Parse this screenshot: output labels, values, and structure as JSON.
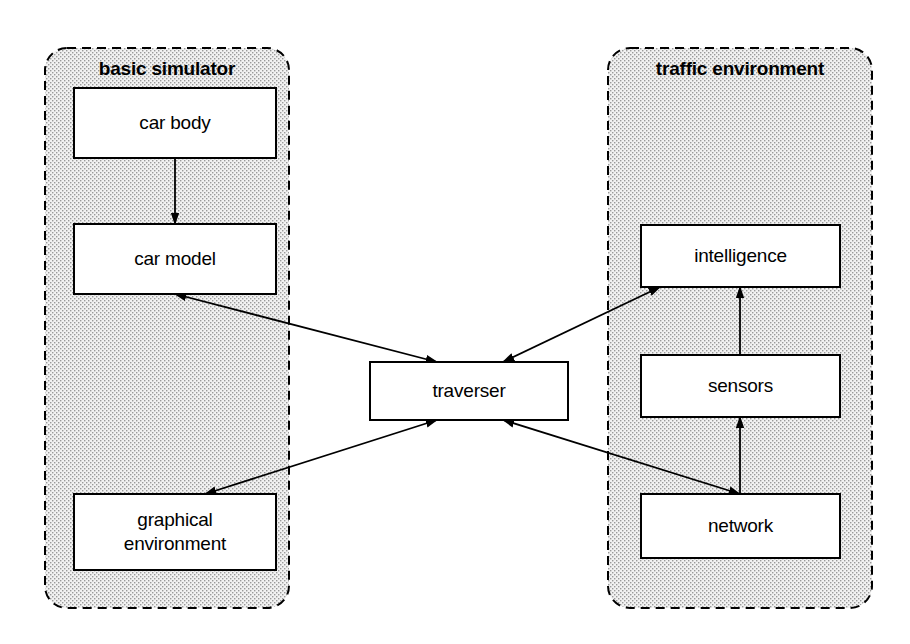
{
  "diagram": {
    "canvas": {
      "width": 910,
      "height": 644
    },
    "colors": {
      "stroke": "#000000",
      "group_fill": "#ececec",
      "group_border": "#000000",
      "node_fill": "#ffffff",
      "page_background": "#ffffff"
    },
    "groups": [
      {
        "id": "basic-simulator",
        "label": "basic simulator",
        "x": 45,
        "y": 48,
        "width": 244,
        "height": 560,
        "radius": 22,
        "label_x": 167,
        "label_y": 58
      },
      {
        "id": "traffic-environment",
        "label": "traffic environment",
        "x": 608,
        "y": 48,
        "width": 264,
        "height": 560,
        "radius": 22,
        "label_x": 740,
        "label_y": 58
      }
    ],
    "nodes": [
      {
        "id": "car-body",
        "label": "car body",
        "lines": [
          "car body"
        ],
        "x": 74,
        "y": 88,
        "width": 202,
        "height": 70,
        "group": "basic-simulator"
      },
      {
        "id": "car-model",
        "label": "car model",
        "lines": [
          "car model"
        ],
        "x": 74,
        "y": 224,
        "width": 202,
        "height": 70,
        "group": "basic-simulator"
      },
      {
        "id": "graphical-environment",
        "label": "graphical environment",
        "lines": [
          "graphical",
          "environment"
        ],
        "x": 74,
        "y": 494,
        "width": 202,
        "height": 76,
        "group": "basic-simulator"
      },
      {
        "id": "traverser",
        "label": "traverser",
        "lines": [
          "traverser"
        ],
        "x": 370,
        "y": 362,
        "width": 198,
        "height": 58,
        "group": null
      },
      {
        "id": "intelligence",
        "label": "intelligence",
        "lines": [
          "intelligence"
        ],
        "x": 641,
        "y": 225,
        "width": 199,
        "height": 62,
        "group": "traffic-environment"
      },
      {
        "id": "sensors",
        "label": "sensors",
        "lines": [
          "sensors"
        ],
        "x": 641,
        "y": 355,
        "width": 199,
        "height": 62,
        "group": "traffic-environment"
      },
      {
        "id": "network",
        "label": "network",
        "lines": [
          "network"
        ],
        "x": 641,
        "y": 494,
        "width": 199,
        "height": 64,
        "group": "traffic-environment"
      }
    ],
    "edges": [
      {
        "id": "car-body-to-car-model",
        "from": "car body",
        "to": "car model",
        "x1": 175,
        "y1": 158,
        "x2": 175,
        "y2": 224,
        "arrow_end": true,
        "arrow_start": false
      },
      {
        "id": "car-model-to-traverser",
        "from": "car model",
        "to": "traverser",
        "x1": 175,
        "y1": 294,
        "x2": 437,
        "y2": 362,
        "arrow_end": true,
        "arrow_start": true
      },
      {
        "id": "intelligence-to-traverser",
        "from": "intelligence",
        "to": "traverser",
        "x1": 660,
        "y1": 287,
        "x2": 503,
        "y2": 362,
        "arrow_end": true,
        "arrow_start": true
      },
      {
        "id": "traverser-to-graphical-environment",
        "from": "traverser",
        "to": "graphical environment",
        "x1": 437,
        "y1": 420,
        "x2": 205,
        "y2": 494,
        "arrow_end": true,
        "arrow_start": true
      },
      {
        "id": "traverser-to-network",
        "from": "traverser",
        "to": "network",
        "x1": 503,
        "y1": 420,
        "x2": 740,
        "y2": 494,
        "arrow_end": true,
        "arrow_start": true
      },
      {
        "id": "network-to-sensors",
        "from": "network",
        "to": "sensors",
        "x1": 740,
        "y1": 494,
        "x2": 740,
        "y2": 417,
        "arrow_end": true,
        "arrow_start": false
      },
      {
        "id": "sensors-to-intelligence",
        "from": "sensors",
        "to": "intelligence",
        "x1": 740,
        "y1": 355,
        "x2": 740,
        "y2": 287,
        "arrow_end": true,
        "arrow_start": false
      }
    ]
  }
}
